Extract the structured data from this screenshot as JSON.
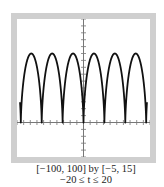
{
  "chart_data": {
    "type": "line",
    "title": "",
    "parametric": {
      "x_expr": "5(t - sin t)",
      "y_expr": "5(1 - cos t)",
      "t_range": [
        -20,
        20
      ]
    },
    "xlim": [
      -100,
      100
    ],
    "ylim": [
      -5,
      15
    ],
    "x_tick_step": 10,
    "y_tick_step": 1,
    "grid": false,
    "series": [
      {
        "name": "cycloid",
        "color": "#111111"
      }
    ],
    "cusps_x": [
      -94.2,
      -62.8,
      -31.4,
      0,
      31.4,
      62.8,
      94.2
    ],
    "peak_y": 10,
    "captions": [
      "[−100, 100] by [−5, 15]",
      "−20 ≤ t ≤ 20"
    ]
  },
  "caption": {
    "window": "[−100, 100] by [−5, 15]",
    "param_range": "−20 ≤ t ≤ 20"
  },
  "colors": {
    "frame": "#cfcfcf",
    "axis": "#777777",
    "curve": "#111111"
  }
}
